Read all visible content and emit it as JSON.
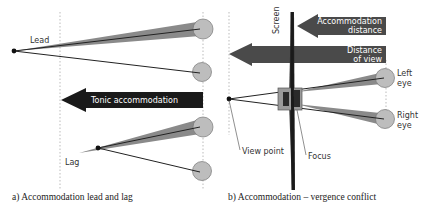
{
  "panel_a": {
    "caption": "a) Accommodation lead and lag",
    "labels": {
      "lead": "Lead",
      "lag": "Lag",
      "tonic": "Tonic accommodation"
    }
  },
  "panel_b": {
    "caption": "b) Accommodation – vergence conflict",
    "labels": {
      "screen": "Screen",
      "accommodation_line1": "Accommodation",
      "accommodation_line2": "distance",
      "distance_line1": "Distance",
      "distance_line2": "of view",
      "left_eye_line1": "Left",
      "left_eye_line2": "eye",
      "right_eye_line1": "Right",
      "right_eye_line2": "eye",
      "view_point": "View point",
      "focus": "Focus"
    }
  },
  "colors": {
    "arrow_dark": "#1a1a1a",
    "arrow_gray": "#4a4a4a",
    "eye_fill": "#bdbdbd",
    "cone_fill": "#8a8a8a",
    "line": "#222222",
    "guide": "#aaaaaa"
  }
}
